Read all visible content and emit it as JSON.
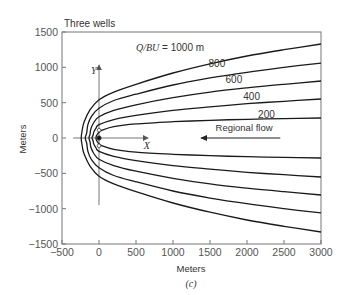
{
  "chart_data": {
    "type": "line",
    "title": "Three wells",
    "xlabel": "Meters",
    "ylabel": "Meters",
    "caption": "(c)",
    "xlim": [
      -500,
      3000
    ],
    "ylim": [
      -1500,
      1500
    ],
    "grid": false,
    "xticks": [
      -500,
      0,
      500,
      1000,
      1500,
      2000,
      2500,
      3000
    ],
    "yticks": [
      1500,
      1000,
      500,
      0,
      -500,
      -1000,
      -1500
    ],
    "xtick_labels": [
      "−500",
      "0",
      "500",
      "1000",
      "1500",
      "2000",
      "2500",
      "3000"
    ],
    "ytick_labels": [
      "1500",
      "1000",
      "500",
      "0",
      "−500",
      "−1000",
      "−1500"
    ],
    "series": [
      {
        "name": "Q/BU = 1000 m",
        "label": "Q/BU = 1000 m",
        "points": [
          [
            3000,
            1330
          ],
          [
            2500,
            1250
          ],
          [
            2000,
            1160
          ],
          [
            1500,
            1050
          ],
          [
            1000,
            920
          ],
          [
            500,
            760
          ],
          [
            200,
            650
          ],
          [
            0,
            540
          ],
          [
            -120,
            400
          ],
          [
            -200,
            230
          ],
          [
            -225,
            120
          ],
          [
            -240,
            0
          ],
          [
            -225,
            -120
          ],
          [
            -200,
            -230
          ],
          [
            -120,
            -400
          ],
          [
            0,
            -540
          ],
          [
            200,
            -650
          ],
          [
            500,
            -760
          ],
          [
            1000,
            -920
          ],
          [
            1500,
            -1050
          ],
          [
            2000,
            -1160
          ],
          [
            2500,
            -1250
          ],
          [
            3000,
            -1330
          ]
        ]
      },
      {
        "name": "800",
        "label": "800",
        "points": [
          [
            3000,
            1060
          ],
          [
            2500,
            1000
          ],
          [
            2000,
            930
          ],
          [
            1500,
            850
          ],
          [
            1000,
            750
          ],
          [
            500,
            620
          ],
          [
            200,
            530
          ],
          [
            0,
            420
          ],
          [
            -100,
            310
          ],
          [
            -150,
            190
          ],
          [
            -165,
            80
          ],
          [
            -185,
            0
          ],
          [
            -165,
            -80
          ],
          [
            -150,
            -190
          ],
          [
            -100,
            -310
          ],
          [
            0,
            -420
          ],
          [
            200,
            -530
          ],
          [
            500,
            -620
          ],
          [
            1000,
            -750
          ],
          [
            1500,
            -850
          ],
          [
            2000,
            -930
          ],
          [
            2500,
            -1000
          ],
          [
            3000,
            -1060
          ]
        ]
      },
      {
        "name": "600",
        "label": "600",
        "points": [
          [
            3000,
            806
          ],
          [
            2500,
            760
          ],
          [
            2000,
            710
          ],
          [
            1500,
            650
          ],
          [
            1000,
            570
          ],
          [
            500,
            470
          ],
          [
            200,
            390
          ],
          [
            0,
            300
          ],
          [
            -70,
            220
          ],
          [
            -110,
            130
          ],
          [
            -120,
            60
          ],
          [
            -135,
            0
          ],
          [
            -120,
            -60
          ],
          [
            -110,
            -130
          ],
          [
            -70,
            -220
          ],
          [
            0,
            -300
          ],
          [
            200,
            -390
          ],
          [
            500,
            -470
          ],
          [
            1000,
            -570
          ],
          [
            1500,
            -650
          ],
          [
            2000,
            -710
          ],
          [
            2500,
            -760
          ],
          [
            3000,
            -806
          ]
        ]
      },
      {
        "name": "400",
        "label": "400",
        "points": [
          [
            3000,
            552
          ],
          [
            2500,
            520
          ],
          [
            2000,
            485
          ],
          [
            1500,
            440
          ],
          [
            1000,
            390
          ],
          [
            500,
            320
          ],
          [
            200,
            260
          ],
          [
            0,
            190
          ],
          [
            -40,
            140
          ],
          [
            -70,
            85
          ],
          [
            -80,
            40
          ],
          [
            -95,
            0
          ],
          [
            -80,
            -40
          ],
          [
            -70,
            -85
          ],
          [
            -40,
            -140
          ],
          [
            0,
            -190
          ],
          [
            200,
            -260
          ],
          [
            500,
            -320
          ],
          [
            1000,
            -390
          ],
          [
            1500,
            -440
          ],
          [
            2000,
            -485
          ],
          [
            2500,
            -520
          ],
          [
            3000,
            -552
          ]
        ]
      },
      {
        "name": "200",
        "label": "200",
        "points": [
          [
            3000,
            283
          ],
          [
            2500,
            275
          ],
          [
            2000,
            265
          ],
          [
            1500,
            250
          ],
          [
            1000,
            230
          ],
          [
            500,
            200
          ],
          [
            200,
            160
          ],
          [
            40,
            110
          ],
          [
            -10,
            70
          ],
          [
            -35,
            30
          ],
          [
            -40,
            0
          ],
          [
            -35,
            -30
          ],
          [
            -10,
            -70
          ],
          [
            40,
            -110
          ],
          [
            200,
            -160
          ],
          [
            500,
            -200
          ],
          [
            1000,
            -230
          ],
          [
            1500,
            -250
          ],
          [
            2000,
            -265
          ],
          [
            2500,
            -275
          ],
          [
            3000,
            -283
          ]
        ]
      }
    ],
    "curve_labels": [
      {
        "text": "Q/BU = 1000 m",
        "x": 500,
        "y": 1230
      },
      {
        "text": "800",
        "x": 1480,
        "y": 1010
      },
      {
        "text": "600",
        "x": 1710,
        "y": 780
      },
      {
        "text": "400",
        "x": 1950,
        "y": 540
      },
      {
        "text": "200",
        "x": 2150,
        "y": 285
      }
    ],
    "wells": [
      [
        0,
        110
      ],
      [
        0,
        0
      ],
      [
        0,
        -110
      ]
    ],
    "local_axes": {
      "x_label": "X",
      "y_label": "Y",
      "x_axis": {
        "from": -350,
        "to": 660,
        "y": 0
      },
      "y_axis": {
        "x": 0,
        "from": -950,
        "to": 1030
      }
    },
    "annotations": [
      {
        "text": "Regional flow",
        "x": 1960,
        "y": 100,
        "arrow": {
          "from": 2450,
          "to": 1380,
          "y": 0
        }
      }
    ]
  }
}
